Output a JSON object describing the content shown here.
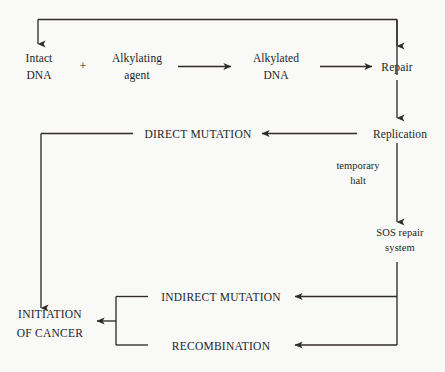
{
  "diagram": {
    "stroke_color": "#2f2b2b",
    "text_color": "#231f1f",
    "background_color": "#f9f9f7",
    "nodes": {
      "intact_dna": "Intact\nDNA",
      "plus": "+",
      "alkylating_agent": "Alkylating\nagent",
      "alkylated_dna": "Alkylated\nDNA",
      "repair": "Repair",
      "replication": "Replication",
      "direct_mutation": "DIRECT MUTATION",
      "sos_repair_system": "SOS repair\nsystem",
      "indirect_mutation": "INDIRECT MUTATION",
      "recombination": "RECOMBINATION",
      "initiation_of_cancer": "INITIATION\nOF CANCER"
    },
    "edge_labels": {
      "temporary_halt": "temporary\nhalt"
    },
    "edges": [
      {
        "from": "intact_dna",
        "to": "alkylated_dna",
        "label": ""
      },
      {
        "from": "alkylated_dna",
        "to": "repair",
        "label": ""
      },
      {
        "from": "repair",
        "to": "intact_dna",
        "label": ""
      },
      {
        "from": "repair",
        "to": "replication",
        "label": ""
      },
      {
        "from": "replication",
        "to": "direct_mutation",
        "label": ""
      },
      {
        "from": "direct_mutation",
        "to": "initiation_of_cancer",
        "label": ""
      },
      {
        "from": "replication",
        "to": "sos_repair_system",
        "label": "temporary halt"
      },
      {
        "from": "sos_repair_system",
        "to": "indirect_mutation",
        "label": ""
      },
      {
        "from": "sos_repair_system",
        "to": "recombination",
        "label": ""
      },
      {
        "from": "indirect_mutation",
        "to": "initiation_of_cancer",
        "label": ""
      },
      {
        "from": "recombination",
        "to": "initiation_of_cancer",
        "label": ""
      }
    ]
  }
}
